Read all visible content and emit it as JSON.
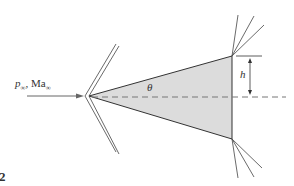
{
  "diagram": {
    "type": "supersonic-flow-over-wedge",
    "figure_number_fragment": "2",
    "freestream_label": {
      "pressure_symbol": "p",
      "pressure_subscript": "∞",
      "separator": ", ",
      "mach_symbol": "Ma",
      "mach_subscript": "∞"
    },
    "angle_label": "θ",
    "height_label": "h",
    "colors": {
      "line": "#333333",
      "wedge_fill": "#dcdcdc",
      "dashed_line": "#777777",
      "arrow": "#666666"
    },
    "elements": [
      "freestream-arrow",
      "oblique-shock-double-line",
      "wedge-body",
      "centerline-dashed",
      "expansion-fan-top",
      "expansion-fan-bottom",
      "height-dimension"
    ]
  }
}
